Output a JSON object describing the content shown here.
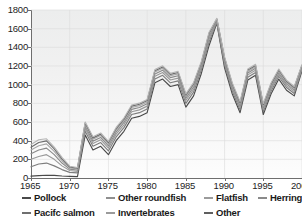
{
  "chart_data": {
    "type": "line",
    "title": "",
    "xlabel": "",
    "ylabel": "",
    "xlim": [
      1965,
      2000
    ],
    "ylim": [
      0,
      1800
    ],
    "grid": true,
    "legend_position": "bottom",
    "note": "Cumulative (stacked) catch lines; seven closely-spaced curves",
    "ytick_labels": [
      "0",
      "200",
      "400",
      "600",
      "800",
      "1000",
      "1200",
      "1400",
      "1600",
      "1800"
    ],
    "yticks": [
      0,
      200,
      400,
      600,
      800,
      1000,
      1200,
      1400,
      1600,
      1800
    ],
    "xtick_labels": [
      "1965",
      "1970",
      "1975",
      "1980",
      "1985",
      "1990",
      "1995",
      "2000"
    ],
    "xticks": [
      1965,
      1970,
      1975,
      1980,
      1985,
      1990,
      1995,
      2000
    ],
    "x": [
      1965,
      1966,
      1967,
      1968,
      1969,
      1970,
      1971,
      1972,
      1973,
      1974,
      1975,
      1976,
      1977,
      1978,
      1979,
      1980,
      1981,
      1982,
      1983,
      1984,
      1985,
      1986,
      1987,
      1988,
      1989,
      1990,
      1991,
      1992,
      1993,
      1994,
      1995,
      1996,
      1997,
      1998,
      1999,
      2000
    ],
    "series": [
      {
        "name": "Pollock",
        "color": "#4a4a4a",
        "values": [
          20,
          25,
          30,
          28,
          22,
          18,
          15,
          460,
          300,
          340,
          250,
          400,
          500,
          640,
          660,
          700,
          1020,
          1060,
          980,
          1000,
          760,
          880,
          1120,
          1420,
          1660,
          1180,
          900,
          700,
          1050,
          1100,
          680,
          900,
          1060,
          940,
          880,
          1150
        ]
      },
      {
        "name": "Pacifc salmon",
        "color": "#7d7d7d",
        "values": [
          120,
          150,
          160,
          130,
          90,
          60,
          55,
          500,
          340,
          380,
          290,
          440,
          540,
          680,
          700,
          740,
          1060,
          1100,
          1020,
          1040,
          800,
          920,
          1160,
          1460,
          1670,
          1210,
          930,
          730,
          1080,
          1130,
          710,
          930,
          1090,
          970,
          905,
          1165
        ]
      },
      {
        "name": "Other roundfish",
        "color": "#9a9a9a",
        "values": [
          200,
          230,
          250,
          200,
          130,
          80,
          70,
          530,
          370,
          410,
          320,
          470,
          570,
          710,
          730,
          770,
          1090,
          1130,
          1050,
          1070,
          830,
          950,
          1185,
          1490,
          1680,
          1235,
          955,
          755,
          1105,
          1155,
          735,
          955,
          1110,
          990,
          925,
          1178
        ]
      },
      {
        "name": "Invertebrates",
        "color": "#8a8a8a",
        "values": [
          260,
          300,
          320,
          250,
          160,
          95,
          85,
          555,
          395,
          435,
          345,
          495,
          595,
          735,
          755,
          795,
          1115,
          1155,
          1075,
          1095,
          855,
          975,
          1205,
          1515,
          1690,
          1255,
          975,
          775,
          1125,
          1175,
          755,
          975,
          1128,
          1008,
          942,
          1190
        ]
      },
      {
        "name": "Flatfish",
        "color": "#a8a8a8",
        "values": [
          300,
          345,
          365,
          285,
          185,
          108,
          95,
          575,
          415,
          455,
          365,
          515,
          615,
          755,
          775,
          815,
          1135,
          1175,
          1095,
          1115,
          875,
          995,
          1222,
          1535,
          1698,
          1272,
          992,
          792,
          1142,
          1192,
          772,
          992,
          1144,
          1024,
          957,
          1200
        ]
      },
      {
        "name": "Other",
        "color": "#6b6b6b",
        "values": [
          330,
          380,
          398,
          312,
          205,
          118,
          104,
          590,
          430,
          470,
          380,
          530,
          630,
          770,
          790,
          830,
          1150,
          1190,
          1110,
          1130,
          890,
          1010,
          1236,
          1550,
          1704,
          1286,
          1006,
          806,
          1156,
          1206,
          786,
          1006,
          1157,
          1037,
          969,
          1208
        ]
      },
      {
        "name": "Herring",
        "color": "#b5b5b5",
        "values": [
          360,
          410,
          420,
          330,
          220,
          126,
          112,
          600,
          442,
          482,
          392,
          542,
          642,
          782,
          802,
          842,
          1162,
          1202,
          1122,
          1142,
          902,
          1022,
          1248,
          1562,
          1710,
          1298,
          1018,
          818,
          1168,
          1218,
          798,
          1018,
          1168,
          1048,
          980,
          1215
        ]
      }
    ]
  },
  "legend": {
    "items": [
      {
        "label": "Pollock",
        "color": "#4a4a4a"
      },
      {
        "label": "Other roundfish",
        "color": "#8f8f8f"
      },
      {
        "label": "Flatfish",
        "color": "#9b9b9b"
      },
      {
        "label": "Herring",
        "color": "#8a8a8a"
      },
      {
        "label": "Pacifc salmon",
        "color": "#6f6f6f"
      },
      {
        "label": "Invertebrates",
        "color": "#9b9b9b"
      },
      {
        "label": "Other",
        "color": "#5f5f5f"
      }
    ]
  }
}
